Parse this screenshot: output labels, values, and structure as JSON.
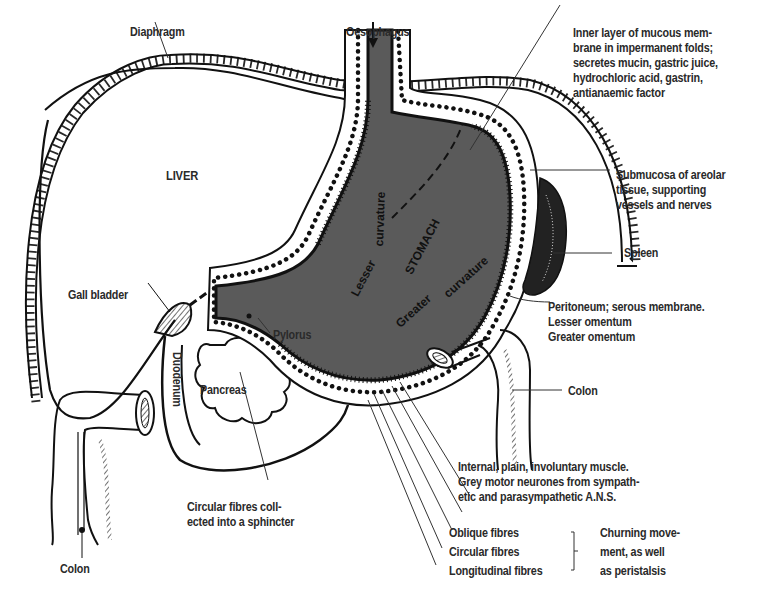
{
  "diagram": {
    "colors": {
      "stomach_fill": "#5a5a5a",
      "line": "#111111",
      "text": "#2a2a2a",
      "background": "#ffffff"
    },
    "organs": {
      "liver": "LIVER",
      "stomach": "STOMACH",
      "lesser_curvature_1": "Lesser",
      "lesser_curvature_2": "curvature",
      "greater_curvature_1": "Greater",
      "greater_curvature_2": "curvature",
      "duodenum": "Duodenum",
      "pancreas": "Pancreas",
      "pylorus": "Pylorus"
    },
    "labels": {
      "diaphragm": "Diaphragm",
      "oesophagus": "Oesophagus",
      "mucous_membrane": "Inner layer of mucous mem-\nbrane in impermanent folds;\nsecretes mucin, gastric juice,\nhydrochloric acid, gastrin,\nantianaemic factor",
      "submucosa": "Submucosa of areolar\ntissue, supporting\nvessels and nerves",
      "spleen": "Spleen",
      "peritoneum": "Peritoneum; serous membrane.\nLesser omentum\nGreater omentum",
      "colon_right": "Colon",
      "gall_bladder": "Gall bladder",
      "muscle": "Internal, plain, involuntary muscle.\nGrey motor neurones from sympath-\netic and parasympathetic A.N.S.",
      "fibres": "Oblique fibres\nCircular fibres\nLongitudinal fibres",
      "churning": "Churning move-\nment, as well\nas peristalsis",
      "sphincter": "Circular fibres coll-\nected into a sphincter",
      "colon_left": "Colon"
    }
  }
}
